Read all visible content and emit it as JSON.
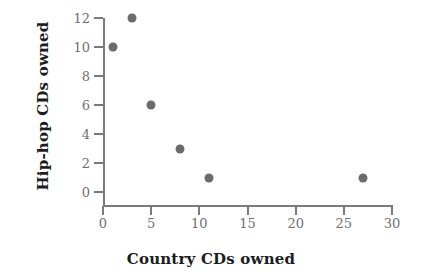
{
  "chart_data": {
    "type": "scatter",
    "title": "",
    "xlabel": "Country CDs owned",
    "ylabel": "Hip-hop CDs owned",
    "xlim": [
      0,
      30
    ],
    "ylim": [
      0,
      12
    ],
    "xticks": [
      0,
      5,
      10,
      15,
      20,
      25,
      30
    ],
    "yticks": [
      0,
      2,
      4,
      6,
      8,
      10,
      12
    ],
    "grid": false,
    "legend": null,
    "marker_color": "#6b6b6b",
    "axis_color": "#7a7a7a",
    "background_color": "#ffffff",
    "points": [
      {
        "x": 1,
        "y": 10
      },
      {
        "x": 3,
        "y": 12
      },
      {
        "x": 5,
        "y": 6
      },
      {
        "x": 8,
        "y": 3
      },
      {
        "x": 11,
        "y": 1
      },
      {
        "x": 27,
        "y": 1
      }
    ],
    "x": [
      1,
      3,
      5,
      8,
      11,
      27
    ],
    "values": [
      10,
      12,
      6,
      3,
      1,
      1
    ]
  }
}
